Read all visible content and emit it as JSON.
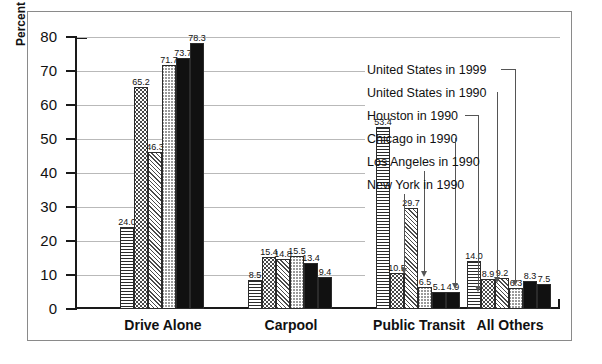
{
  "chart_data": {
    "type": "bar",
    "title": "",
    "xlabel": "",
    "ylabel": "Percent",
    "ylim": [
      0,
      80
    ],
    "yticks": [
      0,
      10,
      20,
      30,
      40,
      50,
      60,
      70,
      80
    ],
    "ytick_labels": [
      "0",
      "10",
      "20",
      "30",
      "40",
      "50",
      "60",
      "70",
      "80"
    ],
    "grid": true,
    "legend_position": "right-callout",
    "categories": [
      "Drive Alone",
      "Carpool",
      "Public Transit",
      "All Others"
    ],
    "series": [
      {
        "name": "New York in 1990",
        "pattern": "horizontal-lines",
        "values": [
          24.0,
          8.5,
          53.4,
          14.0
        ]
      },
      {
        "name": "Los Angeles in 1990",
        "pattern": "dots",
        "values": [
          65.2,
          15.4,
          10.5,
          8.9
        ]
      },
      {
        "name": "Chicago in 1990",
        "pattern": "diagonal-hatch",
        "values": [
          46.3,
          14.8,
          29.7,
          9.2
        ]
      },
      {
        "name": "Houston in 1990",
        "pattern": "wave",
        "values": [
          71.7,
          15.5,
          6.5,
          6.3
        ]
      },
      {
        "name": "United States in 1990",
        "pattern": "solid-black",
        "values": [
          73.7,
          13.4,
          5.1,
          8.3
        ]
      },
      {
        "name": "United States in 1999",
        "pattern": "solid-black",
        "values": [
          78.3,
          9.4,
          4.9,
          7.5
        ]
      }
    ],
    "data_labels": {
      "Drive Alone": [
        "24.0",
        "65.2",
        "46.3",
        "71.7",
        "73.7",
        "78.3"
      ],
      "Carpool": [
        "8.5",
        "15.4",
        "14.8",
        "15.5",
        "13.4",
        "9.4"
      ],
      "Public Transit": [
        "53.4",
        "10.5",
        "29.7",
        "6.5",
        "5.1",
        "4.9"
      ],
      "All Others": [
        "14.0",
        "8.9",
        "9.2",
        "6.3",
        "8.3",
        "7.5"
      ]
    },
    "legend_labels": [
      "United States in 1999",
      "United States in 1990",
      "Houston in 1990",
      "Chicago in 1990",
      "Los Angeles in 1990",
      "New York in 1990"
    ],
    "colors": {
      "axis": "#1a1a1a",
      "grid": "#b9b9b9",
      "solid_bar": "#111111",
      "frame": "#8a8a8a",
      "background": "#ffffff",
      "leader": "#555555"
    }
  }
}
